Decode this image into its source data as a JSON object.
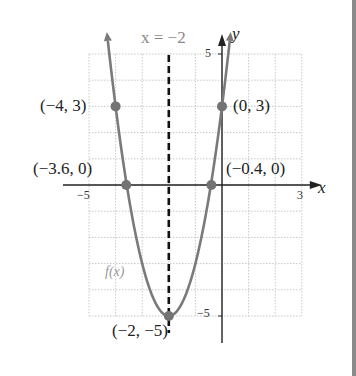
{
  "chart_data": {
    "type": "line",
    "title": "",
    "function_label": "f(x)",
    "xlabel": "x",
    "ylabel": "y",
    "xlim": [
      -5,
      3
    ],
    "ylim": [
      -5,
      5
    ],
    "x_ticks_labeled": [
      -5,
      3
    ],
    "y_ticks_labeled": [
      5,
      -5
    ],
    "grid": true,
    "grid_step": 1,
    "axis_of_symmetry": {
      "label": "x = −2",
      "x": -2,
      "style": "dashed"
    },
    "curve": {
      "equation_form": "parabola opening upward",
      "vertex": [
        -2,
        -5
      ],
      "color": "#7a7a7a"
    },
    "points": [
      {
        "label": "(−4, 3)",
        "x": -4,
        "y": 3
      },
      {
        "label": "(0, 3)",
        "x": 0,
        "y": 3
      },
      {
        "label": "(−3.6, 0)",
        "x": -3.6,
        "y": 0
      },
      {
        "label": "(−0.4, 0)",
        "x": -0.4,
        "y": 0
      },
      {
        "label": "(−2, −5)",
        "x": -2,
        "y": -5
      }
    ]
  },
  "labels": {
    "axis_symmetry": "x = −2",
    "y_axis": "y",
    "x_axis": "x",
    "y_top_tick": "5",
    "y_bottom_tick": "−5",
    "x_left_tick": "−5",
    "x_right_tick": "3",
    "fx": "f(x)",
    "p_m4_3": "(−4, 3)",
    "p_0_3": "(0, 3)",
    "p_m36_0": "(−3.6, 0)",
    "p_m04_0": "(−0.4, 0)",
    "p_vertex": "(−2, −5)"
  },
  "colors": {
    "curve": "#7a7a7a",
    "points": "#737373",
    "grid": "#c8c8c8",
    "axes": "#222222"
  }
}
